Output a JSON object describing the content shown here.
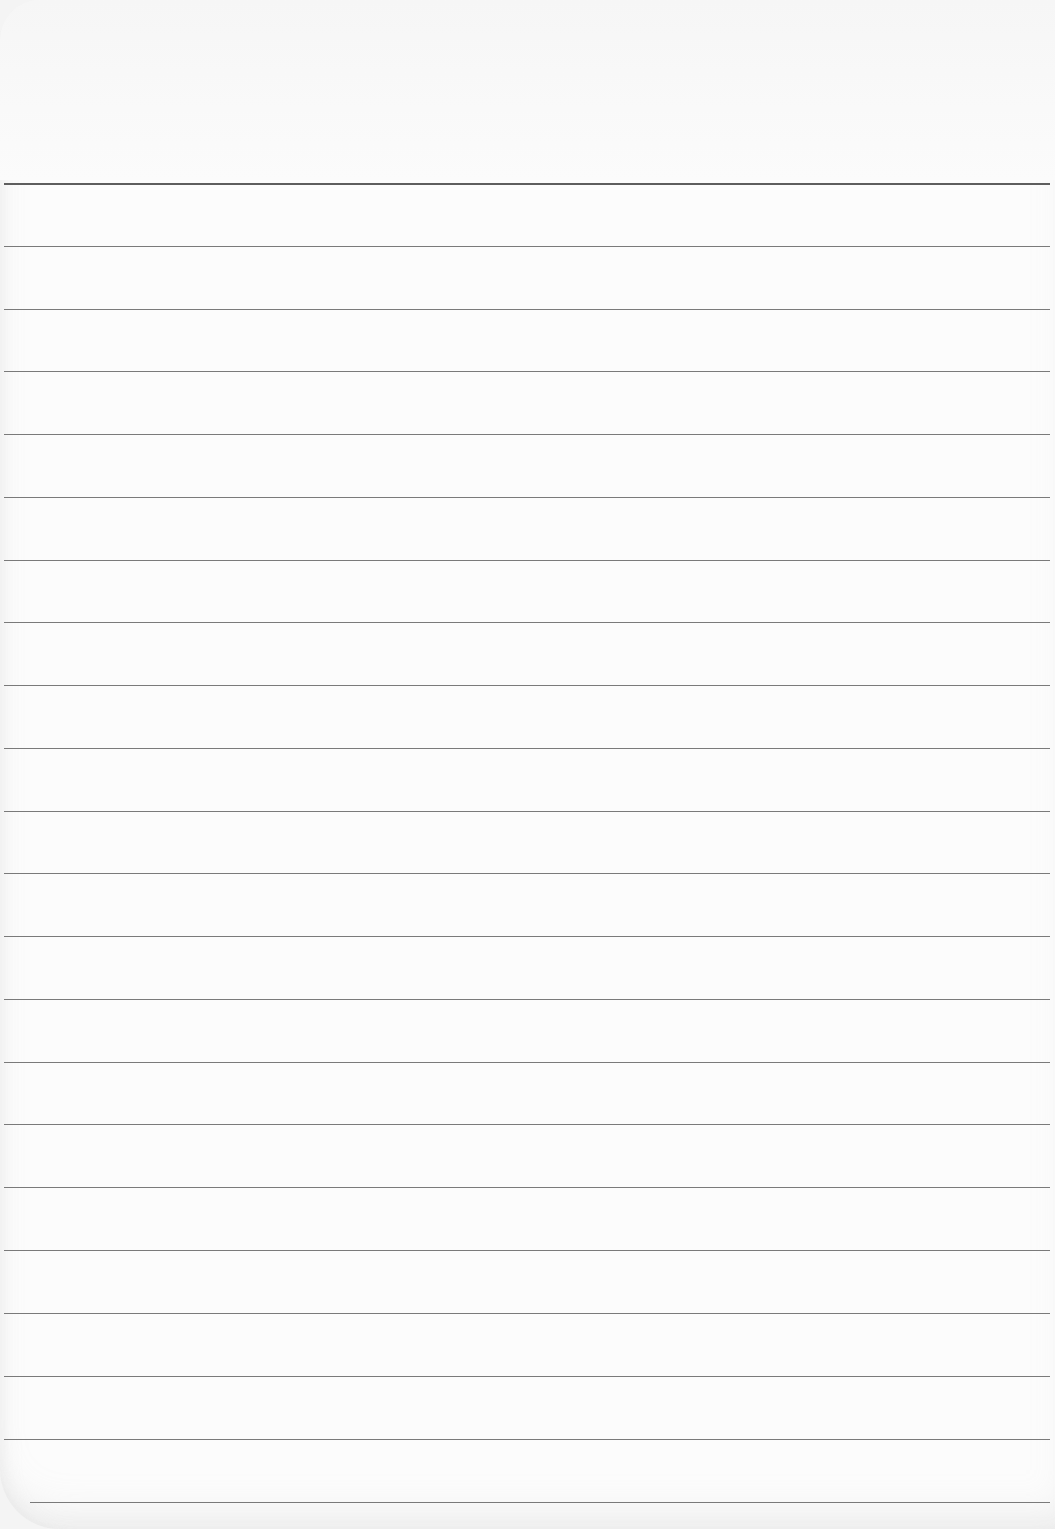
{
  "paper": {
    "type": "lined-sheet",
    "background_color": "#fcfcfc",
    "line_color": "#7a7a7a",
    "top_line_color": "#5e5e5e",
    "line_count": 22,
    "lines": [
      {
        "y": 183,
        "x1": 4,
        "x2": 1050
      },
      {
        "y": 246,
        "x1": 4,
        "x2": 1050
      },
      {
        "y": 309,
        "x1": 4,
        "x2": 1050
      },
      {
        "y": 371,
        "x1": 4,
        "x2": 1050
      },
      {
        "y": 434,
        "x1": 4,
        "x2": 1050
      },
      {
        "y": 497,
        "x1": 4,
        "x2": 1050
      },
      {
        "y": 560,
        "x1": 4,
        "x2": 1050
      },
      {
        "y": 622,
        "x1": 4,
        "x2": 1050
      },
      {
        "y": 685,
        "x1": 4,
        "x2": 1050
      },
      {
        "y": 748,
        "x1": 4,
        "x2": 1050
      },
      {
        "y": 811,
        "x1": 4,
        "x2": 1050
      },
      {
        "y": 873,
        "x1": 4,
        "x2": 1050
      },
      {
        "y": 936,
        "x1": 4,
        "x2": 1050
      },
      {
        "y": 999,
        "x1": 4,
        "x2": 1050
      },
      {
        "y": 1062,
        "x1": 4,
        "x2": 1050
      },
      {
        "y": 1124,
        "x1": 4,
        "x2": 1050
      },
      {
        "y": 1187,
        "x1": 4,
        "x2": 1050
      },
      {
        "y": 1250,
        "x1": 4,
        "x2": 1050
      },
      {
        "y": 1313,
        "x1": 4,
        "x2": 1050
      },
      {
        "y": 1376,
        "x1": 4,
        "x2": 1050
      },
      {
        "y": 1439,
        "x1": 4,
        "x2": 1050
      },
      {
        "y": 1502,
        "x1": 30,
        "x2": 1050
      }
    ]
  }
}
